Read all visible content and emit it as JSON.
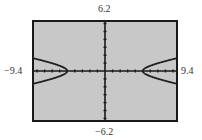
{
  "window": {
    "ymax_label": "6.2",
    "ymin_label": "−6.2",
    "xmin_label": "−9.4",
    "xmax_label": "9.4"
  },
  "colors": {
    "screen_bg": "#c8c8c8",
    "frame": "#1a1a1a",
    "axis": "#1a1a1a",
    "curve": "#222222"
  },
  "chart_data": {
    "type": "line",
    "title": "",
    "xlabel": "",
    "ylabel": "",
    "xlim": [
      -9.4,
      9.4
    ],
    "ylim": [
      -6.2,
      6.2
    ],
    "grid": false,
    "x_ticks_step": 1,
    "y_ticks_step": 1,
    "tick_labels": {
      "top": "6.2",
      "bottom": "−6.2",
      "left": "−9.4",
      "right": "9.4"
    },
    "equation": "x^2/25 - y^2 = 1 (hyperbola, horizontal transverse axis)",
    "vertices": [
      [
        -5,
        0
      ],
      [
        5,
        0
      ]
    ],
    "series": [
      {
        "name": "left-upper",
        "x": [
          -9.4,
          -8,
          -7,
          -6,
          -5.5,
          -5
        ],
        "y": [
          1.59,
          1.25,
          0.98,
          0.66,
          0.46,
          0
        ]
      },
      {
        "name": "left-lower",
        "x": [
          -9.4,
          -8,
          -7,
          -6,
          -5.5,
          -5
        ],
        "y": [
          -1.59,
          -1.25,
          -0.98,
          -0.66,
          -0.46,
          0
        ]
      },
      {
        "name": "right-upper",
        "x": [
          5,
          5.5,
          6,
          7,
          8,
          9.4
        ],
        "y": [
          0,
          0.46,
          0.66,
          0.98,
          1.25,
          1.59
        ]
      },
      {
        "name": "right-lower",
        "x": [
          5,
          5.5,
          6,
          7,
          8,
          9.4
        ],
        "y": [
          0,
          -0.46,
          -0.66,
          -0.98,
          -1.25,
          -1.59
        ]
      }
    ]
  }
}
